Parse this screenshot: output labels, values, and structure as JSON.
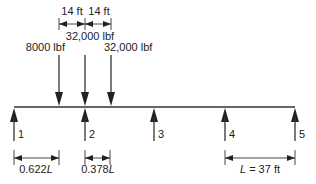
{
  "diagram": {
    "type": "beam-loading",
    "colors": {
      "line": "#333333",
      "text": "#222222",
      "background": "#ffffff"
    },
    "top_dimensions": [
      {
        "label": "14 ft"
      },
      {
        "label": "14 ft"
      }
    ],
    "loads": [
      {
        "label": "8000 lbf"
      },
      {
        "label": "32,000 lbf"
      },
      {
        "label": "32,000 lbf"
      }
    ],
    "supports": [
      {
        "label": "1"
      },
      {
        "label": "2"
      },
      {
        "label": "3"
      },
      {
        "label": "4"
      },
      {
        "label": "5"
      }
    ],
    "bottom_dimensions": [
      {
        "label_num": "0.622",
        "label_var": "L"
      },
      {
        "label_num": "0.378",
        "label_var": "L"
      },
      {
        "label_var": "L",
        "label_rest": " = 37 ft"
      }
    ]
  }
}
